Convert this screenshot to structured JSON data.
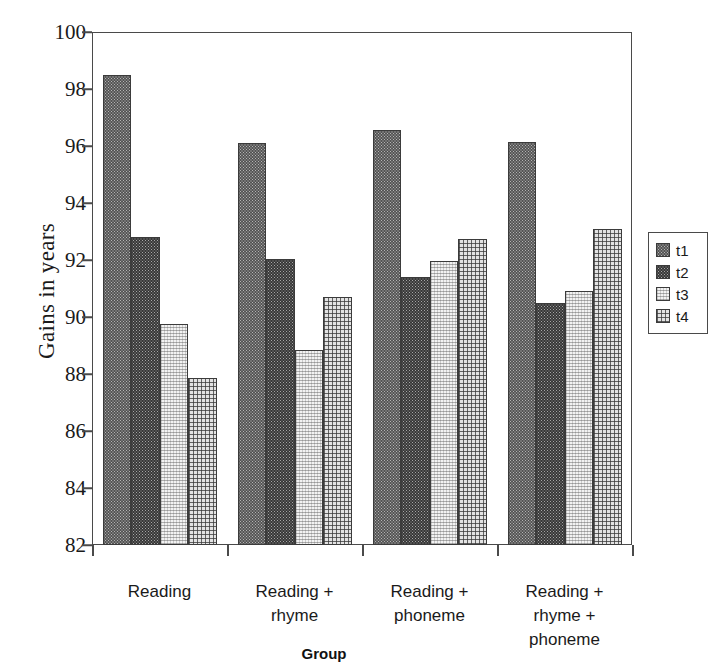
{
  "chart_data": {
    "type": "bar",
    "title": "",
    "xlabel": "Group",
    "ylabel": "Gains in years",
    "ylim": [
      82,
      100
    ],
    "yticks": [
      82,
      84,
      86,
      88,
      90,
      92,
      94,
      96,
      98,
      100
    ],
    "grid": false,
    "legend_position": "right",
    "categories": [
      "Reading",
      "Reading + rhyme",
      "Reading + phoneme",
      "Reading + rhyme + phoneme"
    ],
    "category_lines": [
      [
        "Reading"
      ],
      [
        "Reading +",
        "rhyme"
      ],
      [
        "Reading +",
        "phoneme"
      ],
      [
        "Reading +",
        "rhyme +",
        "phoneme"
      ]
    ],
    "series": [
      {
        "name": "t1",
        "values": [
          98.5,
          96.1,
          96.55,
          96.15
        ]
      },
      {
        "name": "t2",
        "values": [
          92.8,
          92.05,
          91.4,
          90.5
        ]
      },
      {
        "name": "t3",
        "values": [
          89.75,
          88.85,
          91.95,
          90.9
        ]
      },
      {
        "name": "t4",
        "values": [
          87.85,
          90.7,
          92.75,
          93.1
        ]
      }
    ]
  },
  "legend": {
    "entries": [
      {
        "label": "t1"
      },
      {
        "label": "t2"
      },
      {
        "label": "t3"
      },
      {
        "label": "t4"
      }
    ]
  },
  "colors": {
    "axis": "#4a4a4a",
    "bar_outline": "#3b3b3b",
    "text": "#1a1a1a",
    "background": "#ffffff",
    "t1": "#b4b4b4",
    "t2": "#a6a6a6",
    "t3": "#f2f2f2",
    "t4": "#e3e3e3"
  }
}
